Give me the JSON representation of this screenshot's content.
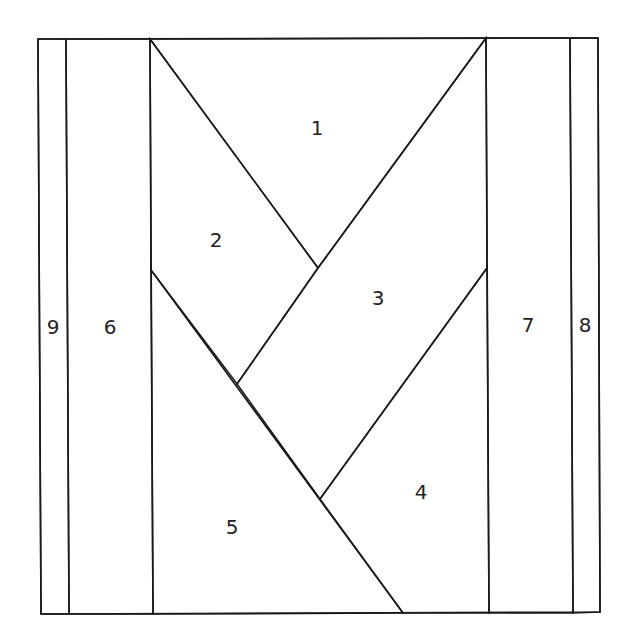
{
  "diagram": {
    "type": "paper-piecing-quilt-block",
    "colors": {
      "shaded_fill": "#e9e9e9",
      "grid_line": "#dcdcdc",
      "unshaded_fill": "#ffffff",
      "outline": "#1a1a1a",
      "label": "#222222"
    },
    "pieces": [
      {
        "id": "1",
        "label": "1",
        "shaded": false,
        "label_x": 317,
        "label_y": 129
      },
      {
        "id": "2",
        "label": "2",
        "shaded": true,
        "label_x": 216,
        "label_y": 241
      },
      {
        "id": "3",
        "label": "3",
        "shaded": true,
        "label_x": 378,
        "label_y": 299
      },
      {
        "id": "4",
        "label": "4",
        "shaded": false,
        "label_x": 421,
        "label_y": 493
      },
      {
        "id": "5",
        "label": "5",
        "shaded": false,
        "label_x": 232,
        "label_y": 528
      },
      {
        "id": "6",
        "label": "6",
        "shaded": true,
        "label_x": 110,
        "label_y": 328
      },
      {
        "id": "7",
        "label": "7",
        "shaded": true,
        "label_x": 528,
        "label_y": 326
      },
      {
        "id": "8",
        "label": "8",
        "shaded": false,
        "label_x": 585,
        "label_y": 326
      },
      {
        "id": "9",
        "label": "9",
        "shaded": false,
        "label_x": 53,
        "label_y": 328
      }
    ]
  }
}
